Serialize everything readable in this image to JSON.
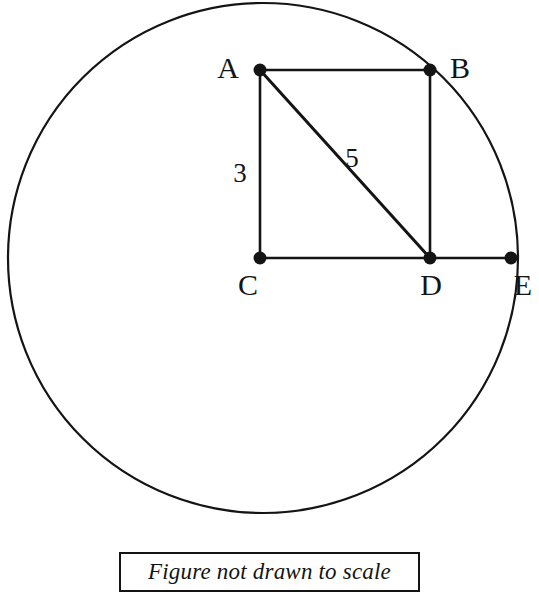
{
  "figure": {
    "background_color": "#ffffff",
    "stroke_color": "#141414",
    "caption": {
      "text": "Figure not drawn to scale",
      "box_border_color": "#141414"
    },
    "circle": {
      "name": "circle",
      "center_x": 263,
      "center_y": 258,
      "radius": 255,
      "stroke_width": 2.2
    },
    "points": [
      {
        "id": "A",
        "label": "A",
        "x": 260,
        "y": 70,
        "label_x": 228,
        "label_y": 78,
        "on_circle": false
      },
      {
        "id": "B",
        "label": "B",
        "x": 430,
        "y": 70,
        "label_x": 445,
        "label_y": 78,
        "on_circle": true
      },
      {
        "id": "C",
        "label": "C",
        "x": 260,
        "y": 258,
        "label_x": 245,
        "label_y": 295,
        "on_circle": false
      },
      {
        "id": "D",
        "label": "D",
        "x": 430,
        "y": 258,
        "label_x": 418,
        "label_y": 295,
        "on_circle": false
      },
      {
        "id": "E",
        "label": "E",
        "x": 511,
        "y": 258,
        "label_x": 514,
        "label_y": 295,
        "on_circle": true
      }
    ],
    "dot_radius": 6,
    "segments": [
      {
        "name": "segment-AB",
        "from": "A",
        "to": "B",
        "x1": 260,
        "y1": 70,
        "x2": 430,
        "y2": 70,
        "width": 2.6
      },
      {
        "name": "segment-AC",
        "from": "A",
        "to": "C",
        "x1": 260,
        "y1": 70,
        "x2": 260,
        "y2": 258,
        "width": 2.6
      },
      {
        "name": "segment-BD",
        "from": "B",
        "to": "D",
        "x1": 430,
        "y1": 70,
        "x2": 430,
        "y2": 258,
        "width": 2.6
      },
      {
        "name": "segment-CE",
        "from": "C",
        "to": "E",
        "x1": 260,
        "y1": 258,
        "x2": 511,
        "y2": 258,
        "width": 2.6
      },
      {
        "name": "segment-AD-diagonal",
        "from": "A",
        "to": "D",
        "x1": 260,
        "y1": 70,
        "x2": 430,
        "y2": 258,
        "width": 3.0
      }
    ],
    "measures": [
      {
        "name": "length-label-AC",
        "value": "3",
        "for_segment": "segment-AC",
        "x": 232,
        "y": 180
      },
      {
        "name": "length-label-AD",
        "value": "5",
        "for_segment": "segment-AD-diagonal",
        "x": 344,
        "y": 163
      }
    ]
  }
}
